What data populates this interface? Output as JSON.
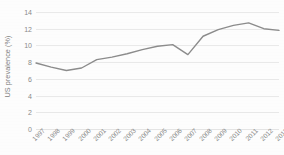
{
  "chart_data": {
    "type": "line",
    "title": "",
    "xlabel": "",
    "ylabel": "US prevalence (%)",
    "ylim": [
      0,
      14
    ],
    "yticks": [
      0,
      2,
      4,
      6,
      8,
      10,
      12,
      14
    ],
    "ytick_labels": [
      "0",
      "2",
      "4",
      "6",
      "8",
      "10",
      "12",
      "14"
    ],
    "grid": true,
    "grid_axis": "y",
    "legend": false,
    "legend_position": "none",
    "line_color": "#8c8c8c",
    "line_width": 1.4,
    "markers": false,
    "categories": [
      "1997",
      "1998",
      "1999",
      "2000",
      "2001",
      "2002",
      "2003",
      "2004",
      "2005",
      "2006",
      "2007",
      "2008",
      "2009",
      "2010",
      "2011",
      "2012",
      "2013"
    ],
    "x": [
      1997,
      1998,
      1999,
      2000,
      2001,
      2002,
      2003,
      2004,
      2005,
      2006,
      2007,
      2008,
      2009,
      2010,
      2011,
      2012,
      2013
    ],
    "values": [
      7.9,
      7.4,
      7.0,
      7.3,
      8.3,
      8.6,
      9.0,
      9.5,
      9.9,
      10.1,
      8.9,
      11.1,
      11.9,
      12.4,
      12.7,
      12.0,
      11.8
    ],
    "series": [
      {
        "name": "US prevalence",
        "values": [
          7.9,
          7.4,
          7.0,
          7.3,
          8.3,
          8.6,
          9.0,
          9.5,
          9.9,
          10.1,
          8.9,
          11.1,
          11.9,
          12.4,
          12.7,
          12.0,
          11.8
        ]
      }
    ]
  },
  "axis": {
    "y_title": "US prevalence (%)"
  },
  "colors": {
    "line": "#8c8c8c",
    "grid": "#e9e9e9",
    "text": "#8a8a8a",
    "background": "#fdfdfd"
  }
}
